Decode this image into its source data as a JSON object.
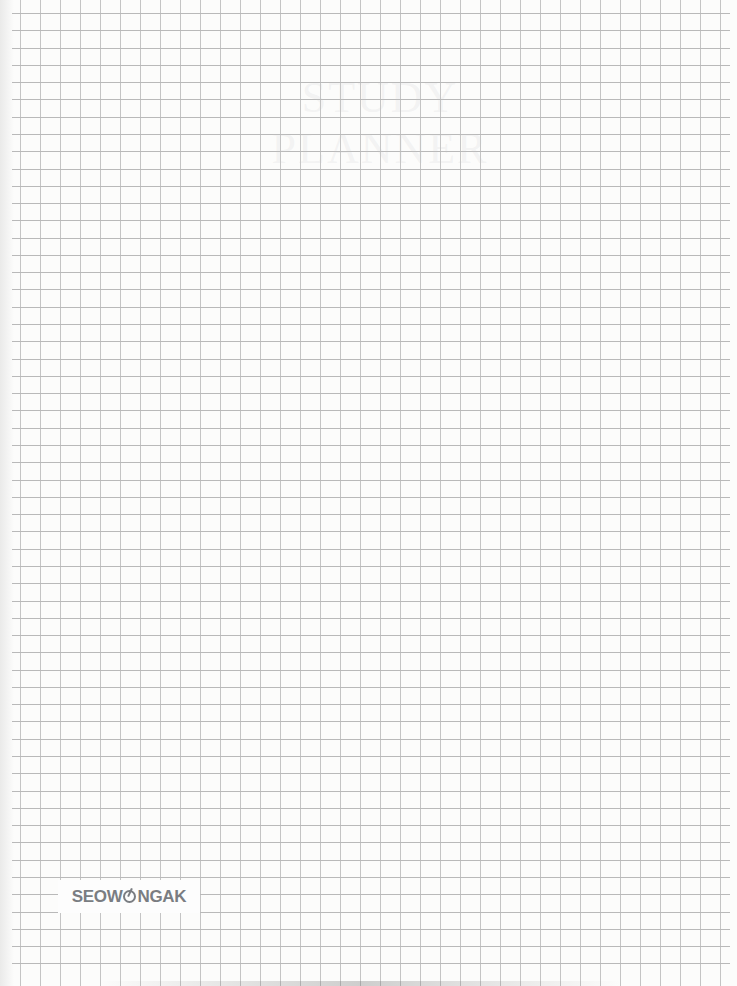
{
  "document": {
    "type": "graph-paper-notebook-page",
    "title_watermark": "STUDY PLANNER",
    "grid": {
      "column_spacing_px": 20,
      "row_spacing_px": 17.28,
      "line_color": "#c4c4c4",
      "background": "#fcfcfb"
    }
  },
  "logo": {
    "prefix": "SEOW",
    "o_glyph": "o-mark-icon",
    "suffix": "NGAK",
    "color": "#7a7d82"
  }
}
